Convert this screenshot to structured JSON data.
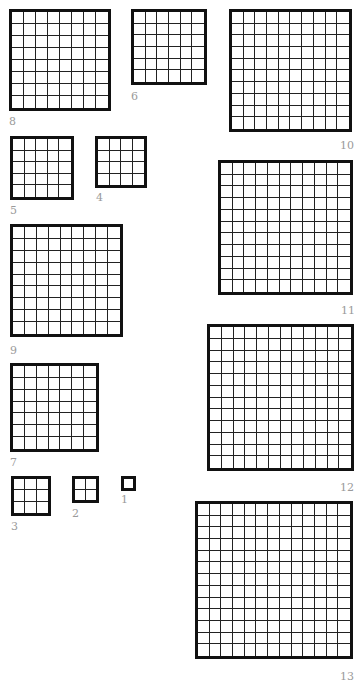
{
  "line_color": "#111111",
  "label_color": "#9a9a9a",
  "grids": [
    {
      "n": 1,
      "label": "1",
      "x": 121,
      "y": 476,
      "size": 15,
      "label_x": 121,
      "label_y": 494,
      "label_align": "left"
    },
    {
      "n": 2,
      "label": "2",
      "x": 72,
      "y": 476,
      "size": 27,
      "label_x": 72,
      "label_y": 508,
      "label_align": "left"
    },
    {
      "n": 3,
      "label": "3",
      "x": 11,
      "y": 476,
      "size": 40,
      "label_x": 11,
      "label_y": 521,
      "label_align": "left"
    },
    {
      "n": 4,
      "label": "4",
      "x": 95,
      "y": 136,
      "size": 52,
      "label_x": 96,
      "label_y": 192,
      "label_align": "left"
    },
    {
      "n": 5,
      "label": "5",
      "x": 10,
      "y": 136,
      "size": 64,
      "label_x": 10,
      "label_y": 205,
      "label_align": "left"
    },
    {
      "n": 6,
      "label": "6",
      "x": 131,
      "y": 9,
      "size": 76,
      "label_x": 131,
      "label_y": 91,
      "label_align": "left"
    },
    {
      "n": 7,
      "label": "7",
      "x": 10,
      "y": 363,
      "size": 89,
      "label_x": 10,
      "label_y": 457,
      "label_align": "left"
    },
    {
      "n": 8,
      "label": "8",
      "x": 9,
      "y": 9,
      "size": 102,
      "label_x": 9,
      "label_y": 116,
      "label_align": "left"
    },
    {
      "n": 9,
      "label": "9",
      "x": 10,
      "y": 224,
      "size": 113,
      "label_x": 10,
      "label_y": 345,
      "label_align": "left"
    },
    {
      "n": 10,
      "label": "10",
      "x": 229,
      "y": 9,
      "size": 123,
      "label_x": 340,
      "label_y": 140,
      "label_align": "right"
    },
    {
      "n": 11,
      "label": "11",
      "x": 218,
      "y": 160,
      "size": 135,
      "label_x": 341,
      "label_y": 305,
      "label_align": "right"
    },
    {
      "n": 12,
      "label": "12",
      "x": 207,
      "y": 324,
      "size": 147,
      "label_x": 340,
      "label_y": 482,
      "label_align": "right"
    },
    {
      "n": 13,
      "label": "13",
      "x": 195,
      "y": 501,
      "size": 158,
      "label_x": 340,
      "label_y": 671,
      "label_align": "right"
    }
  ]
}
